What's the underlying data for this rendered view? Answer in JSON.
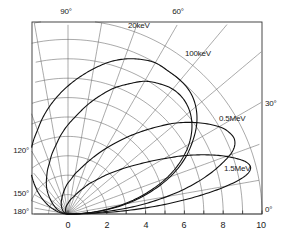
{
  "chart_data": {
    "type": "line",
    "subtype": "polar-lobe-diagram",
    "title": "",
    "xlabel": "",
    "ylabel": "",
    "xlim": [
      0,
      10
    ],
    "radial_axis": {
      "min": 0,
      "max": 10,
      "tick_step": 1,
      "labeled_ticks": [
        0,
        2,
        4,
        6,
        8,
        10
      ],
      "labels": [
        "0",
        "2",
        "4",
        "6",
        "8",
        "10"
      ]
    },
    "angular_axis": {
      "min_deg": 0,
      "max_deg": 180,
      "grid_step_deg": 10,
      "labeled_angles": [
        0,
        30,
        60,
        90,
        120,
        150,
        180
      ],
      "labels": [
        "0°",
        "30°",
        "60°",
        "90°",
        "120°",
        "150°",
        "180°"
      ]
    },
    "grid": true,
    "grid_color": "#555555",
    "frame_color": "#333333",
    "curve_color": "#111111",
    "legend": "inline-annotations",
    "series": [
      {
        "name": "20 keV",
        "label": "20keV",
        "label_pos": {
          "x": 128,
          "y": 27
        },
        "peak_angle_deg": 60,
        "peak_radius": 9.0,
        "points_deg_r": [
          [
            0,
            0.0
          ],
          [
            5,
            1.6
          ],
          [
            10,
            3.1
          ],
          [
            15,
            4.4
          ],
          [
            20,
            5.6
          ],
          [
            25,
            6.6
          ],
          [
            30,
            7.4
          ],
          [
            35,
            8.1
          ],
          [
            40,
            8.6
          ],
          [
            45,
            8.9
          ],
          [
            50,
            9.0
          ],
          [
            55,
            9.0
          ],
          [
            60,
            9.0
          ],
          [
            65,
            8.8
          ],
          [
            70,
            8.5
          ],
          [
            75,
            8.1
          ],
          [
            80,
            7.6
          ],
          [
            85,
            7.1
          ],
          [
            90,
            6.6
          ],
          [
            95,
            6.1
          ],
          [
            100,
            5.6
          ],
          [
            105,
            5.1
          ],
          [
            110,
            4.6
          ],
          [
            115,
            4.2
          ],
          [
            120,
            3.8
          ],
          [
            130,
            3.0
          ],
          [
            140,
            2.2
          ],
          [
            150,
            1.5
          ],
          [
            160,
            0.9
          ],
          [
            170,
            0.4
          ],
          [
            180,
            0.0
          ]
        ]
      },
      {
        "name": "100 keV",
        "label": "100keV",
        "label_pos": {
          "x": 185,
          "y": 55
        },
        "peak_angle_deg": 45,
        "peak_radius": 8.4,
        "points_deg_r": [
          [
            0,
            0.0
          ],
          [
            5,
            1.5
          ],
          [
            10,
            2.9
          ],
          [
            15,
            4.2
          ],
          [
            20,
            5.4
          ],
          [
            25,
            6.4
          ],
          [
            30,
            7.2
          ],
          [
            35,
            7.8
          ],
          [
            40,
            8.2
          ],
          [
            45,
            8.4
          ],
          [
            50,
            8.4
          ],
          [
            55,
            8.2
          ],
          [
            60,
            7.9
          ],
          [
            65,
            7.4
          ],
          [
            70,
            6.9
          ],
          [
            75,
            6.3
          ],
          [
            80,
            5.7
          ],
          [
            85,
            5.1
          ],
          [
            90,
            4.6
          ],
          [
            95,
            4.1
          ],
          [
            100,
            3.6
          ],
          [
            105,
            3.2
          ],
          [
            110,
            2.8
          ],
          [
            115,
            2.5
          ],
          [
            120,
            2.2
          ],
          [
            130,
            1.7
          ],
          [
            140,
            1.2
          ],
          [
            150,
            0.8
          ],
          [
            160,
            0.5
          ],
          [
            170,
            0.2
          ],
          [
            180,
            0.0
          ]
        ]
      },
      {
        "name": "0.5 MeV",
        "label": "0.5MeV",
        "label_pos": {
          "x": 219,
          "y": 120
        },
        "peak_angle_deg": 22,
        "peak_radius": 9.4,
        "points_deg_r": [
          [
            0,
            0.0
          ],
          [
            3,
            1.6
          ],
          [
            6,
            3.2
          ],
          [
            9,
            4.7
          ],
          [
            12,
            6.1
          ],
          [
            15,
            7.3
          ],
          [
            18,
            8.3
          ],
          [
            21,
            9.1
          ],
          [
            24,
            9.4
          ],
          [
            27,
            9.3
          ],
          [
            30,
            9.0
          ],
          [
            35,
            8.2
          ],
          [
            40,
            7.3
          ],
          [
            45,
            6.3
          ],
          [
            50,
            5.4
          ],
          [
            55,
            4.6
          ],
          [
            60,
            3.9
          ],
          [
            65,
            3.3
          ],
          [
            70,
            2.8
          ],
          [
            75,
            2.4
          ],
          [
            80,
            2.1
          ],
          [
            85,
            1.8
          ],
          [
            90,
            1.6
          ],
          [
            100,
            1.2
          ],
          [
            110,
            0.9
          ],
          [
            120,
            0.7
          ],
          [
            135,
            0.45
          ],
          [
            150,
            0.28
          ],
          [
            165,
            0.13
          ],
          [
            180,
            0.0
          ]
        ]
      },
      {
        "name": "1.5 MeV",
        "label": "1.5MeV",
        "label_pos": {
          "x": 224,
          "y": 170
        },
        "peak_angle_deg": 12,
        "peak_radius": 9.7,
        "points_deg_r": [
          [
            0,
            0.0
          ],
          [
            2,
            1.8
          ],
          [
            4,
            3.6
          ],
          [
            6,
            5.3
          ],
          [
            8,
            6.9
          ],
          [
            10,
            8.3
          ],
          [
            12,
            9.3
          ],
          [
            14,
            9.7
          ],
          [
            16,
            9.6
          ],
          [
            18,
            9.2
          ],
          [
            21,
            8.4
          ],
          [
            24,
            7.5
          ],
          [
            27,
            6.6
          ],
          [
            30,
            5.7
          ],
          [
            35,
            4.5
          ],
          [
            40,
            3.6
          ],
          [
            45,
            2.9
          ],
          [
            50,
            2.3
          ],
          [
            55,
            1.9
          ],
          [
            60,
            1.5
          ],
          [
            70,
            1.0
          ],
          [
            80,
            0.75
          ],
          [
            90,
            0.55
          ],
          [
            105,
            0.38
          ],
          [
            120,
            0.25
          ],
          [
            140,
            0.14
          ],
          [
            160,
            0.06
          ],
          [
            180,
            0.0
          ]
        ]
      }
    ]
  },
  "axis_labels": {
    "radial": [
      {
        "text": "0",
        "x": 68,
        "y": 226
      },
      {
        "text": "2",
        "x": 107,
        "y": 226
      },
      {
        "text": "4",
        "x": 146,
        "y": 226
      },
      {
        "text": "6",
        "x": 184,
        "y": 226
      },
      {
        "text": "8",
        "x": 223,
        "y": 226
      },
      {
        "text": "10",
        "x": 261,
        "y": 226
      }
    ],
    "angular": [
      {
        "text": "90°",
        "x": 66,
        "y": 13,
        "anchor": "middle"
      },
      {
        "text": "60°",
        "x": 178,
        "y": 13,
        "anchor": "middle"
      },
      {
        "text": "30°",
        "x": 265,
        "y": 105,
        "anchor": "start"
      },
      {
        "text": "0°",
        "x": 265,
        "y": 211,
        "anchor": "start"
      },
      {
        "text": "120°",
        "x": 29,
        "y": 152,
        "anchor": "end"
      },
      {
        "text": "150°",
        "x": 29,
        "y": 195,
        "anchor": "end"
      },
      {
        "text": "180°",
        "x": 29,
        "y": 213,
        "anchor": "end"
      }
    ]
  },
  "geometry": {
    "origin_x": 68,
    "origin_y": 214,
    "px_per_unit": 19.4,
    "frame_left": 32,
    "frame_top": 22,
    "frame_right": 262,
    "frame_bottom": 214
  }
}
